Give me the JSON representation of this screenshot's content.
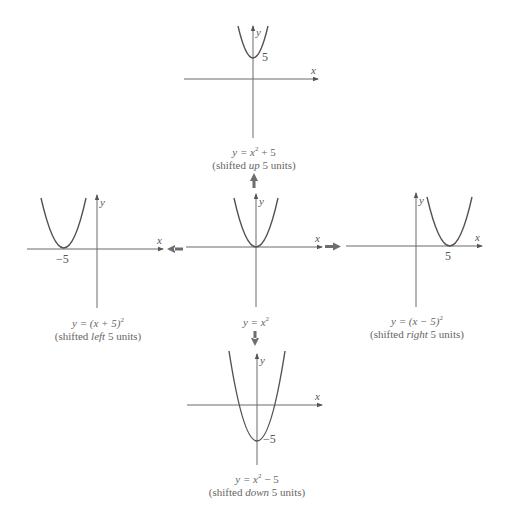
{
  "diagram": {
    "title": "",
    "colors": {
      "axis": "#6a6a6a",
      "curve": "#5a5050",
      "arrow": "#6e6e6e",
      "text": "#555555"
    },
    "graphs": {
      "center": {
        "equation_lhs": "y = x",
        "equation_sup": "2",
        "equation_rhs": "",
        "x_label": "x",
        "y_label": "y",
        "vertex_label": ""
      },
      "up": {
        "equation_lhs": "y = x",
        "equation_sup": "2",
        "equation_rhs": " + 5",
        "desc_pre": "(shifted ",
        "desc_em": "up",
        "desc_post": " 5 units)",
        "x_label": "x",
        "y_label": "y",
        "vertex_label": "5"
      },
      "left": {
        "equation_lhs": "y = (x + 5)",
        "equation_sup": "2",
        "equation_rhs": "",
        "desc_pre": "(shifted ",
        "desc_em": "left",
        "desc_post": " 5 units)",
        "x_label": "x",
        "y_label": "y",
        "vertex_label": "−5"
      },
      "right": {
        "equation_lhs": "y = (x − 5)",
        "equation_sup": "2",
        "equation_rhs": "",
        "desc_pre": "(shifted ",
        "desc_em": "right",
        "desc_post": " 5 units)",
        "x_label": "x",
        "y_label": "y",
        "vertex_label": "5"
      },
      "down": {
        "equation_lhs": "y = x",
        "equation_sup": "2",
        "equation_rhs": " − 5",
        "desc_pre": "(shifted ",
        "desc_em": "down",
        "desc_post": " 5 units)",
        "x_label": "x",
        "y_label": "y",
        "vertex_label": "−5"
      }
    },
    "arrows": [
      "up",
      "left",
      "right",
      "down"
    ]
  }
}
